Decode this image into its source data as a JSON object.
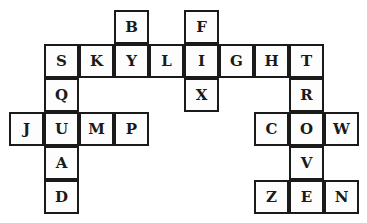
{
  "puzzle": {
    "type": "word-grid",
    "cell_width": 35,
    "cell_height": 34,
    "origin_x": 9,
    "origin_y": 10,
    "words": [
      {
        "word": "SKYLIGHT",
        "direction": "across",
        "row": 1,
        "col": 1
      },
      {
        "word": "JUMP",
        "direction": "across",
        "row": 3,
        "col": 0
      },
      {
        "word": "COW",
        "direction": "across",
        "row": 3,
        "col": 7
      },
      {
        "word": "ZEN",
        "direction": "across",
        "row": 5,
        "col": 7
      },
      {
        "word": "SQUAD",
        "direction": "down",
        "row": 1,
        "col": 1
      },
      {
        "word": "BY",
        "direction": "down",
        "row": 0,
        "col": 3
      },
      {
        "word": "FIX",
        "direction": "down",
        "row": 0,
        "col": 5
      },
      {
        "word": "TROVE",
        "direction": "down",
        "row": 1,
        "col": 8
      }
    ],
    "cells": [
      {
        "letter": "B",
        "row": 0,
        "col": 3
      },
      {
        "letter": "F",
        "row": 0,
        "col": 5
      },
      {
        "letter": "S",
        "row": 1,
        "col": 1
      },
      {
        "letter": "K",
        "row": 1,
        "col": 2
      },
      {
        "letter": "Y",
        "row": 1,
        "col": 3
      },
      {
        "letter": "L",
        "row": 1,
        "col": 4
      },
      {
        "letter": "I",
        "row": 1,
        "col": 5
      },
      {
        "letter": "G",
        "row": 1,
        "col": 6
      },
      {
        "letter": "H",
        "row": 1,
        "col": 7
      },
      {
        "letter": "T",
        "row": 1,
        "col": 8
      },
      {
        "letter": "Q",
        "row": 2,
        "col": 1
      },
      {
        "letter": "X",
        "row": 2,
        "col": 5
      },
      {
        "letter": "R",
        "row": 2,
        "col": 8
      },
      {
        "letter": "J",
        "row": 3,
        "col": 0
      },
      {
        "letter": "U",
        "row": 3,
        "col": 1
      },
      {
        "letter": "M",
        "row": 3,
        "col": 2
      },
      {
        "letter": "P",
        "row": 3,
        "col": 3
      },
      {
        "letter": "C",
        "row": 3,
        "col": 7
      },
      {
        "letter": "O",
        "row": 3,
        "col": 8
      },
      {
        "letter": "W",
        "row": 3,
        "col": 9
      },
      {
        "letter": "A",
        "row": 4,
        "col": 1
      },
      {
        "letter": "V",
        "row": 4,
        "col": 8
      },
      {
        "letter": "D",
        "row": 5,
        "col": 1
      },
      {
        "letter": "Z",
        "row": 5,
        "col": 7
      },
      {
        "letter": "E",
        "row": 5,
        "col": 8
      },
      {
        "letter": "N",
        "row": 5,
        "col": 9
      }
    ],
    "colors": {
      "border": "#1a1a1a",
      "cell_bg": "#fdfdfd",
      "letter": "#1a1a1a",
      "page_bg": "#ffffff"
    }
  }
}
